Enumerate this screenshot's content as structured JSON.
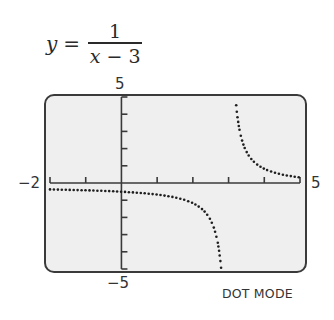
{
  "equation": {
    "lhs": "y",
    "equals": "=",
    "numerator": "1",
    "denominator_var": "x",
    "denominator_rest": " − 3"
  },
  "window_labels": {
    "ymax": "5",
    "ymin": "−5",
    "xmin": "−2",
    "xmax": "5"
  },
  "mode_label": "DOT MODE",
  "colors": {
    "screen_bg": "#efefef",
    "frame": "#3a3a3a",
    "axis": "#3a3a3a",
    "dots": "#1e1e1e"
  },
  "chart_data": {
    "type": "scatter",
    "subtitle": "DOT MODE",
    "function": "1/(x-3)",
    "xlabel": "",
    "ylabel": "",
    "xlim": [
      -2,
      5
    ],
    "ylim": [
      -5,
      5
    ],
    "xscale_ticks": [
      -2,
      -1,
      0,
      1,
      2,
      3,
      4,
      5
    ],
    "yscale_ticks": [
      -5,
      -4,
      -3,
      -2,
      -1,
      0,
      1,
      2,
      3,
      4,
      5
    ],
    "tick_labels": {
      "x": [
        "−2",
        "5"
      ],
      "y": [
        "5",
        "−5"
      ]
    },
    "vertical_asymptote": 3,
    "horizontal_asymptote": 0,
    "grid": false,
    "legend": null,
    "series": [
      {
        "name": "left branch",
        "x": [
          -2,
          -1.5,
          -1,
          -0.5,
          0,
          0.5,
          1,
          1.5,
          2,
          2.25,
          2.5,
          2.6,
          2.7,
          2.8
        ],
        "y": [
          -0.2,
          -0.22,
          -0.25,
          -0.29,
          -0.33,
          -0.4,
          -0.5,
          -0.67,
          -1,
          -1.33,
          -2,
          -2.5,
          -3.33,
          -5
        ]
      },
      {
        "name": "right branch",
        "x": [
          3.2,
          3.3,
          3.4,
          3.5,
          3.75,
          4,
          4.5,
          5
        ],
        "y": [
          5,
          3.33,
          2.5,
          2,
          1.33,
          1,
          0.67,
          0.5
        ]
      }
    ]
  }
}
